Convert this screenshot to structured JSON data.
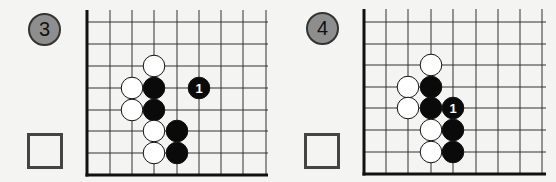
{
  "problems": [
    {
      "number": "3",
      "board": {
        "origin_x": 87,
        "bottom_y": 175,
        "cols_x": [
          87,
          110,
          132,
          154,
          177,
          199,
          221,
          243,
          266
        ],
        "rows_y": [
          22,
          44,
          66,
          88,
          110,
          131,
          153,
          175
        ],
        "top_y": 10,
        "right_x": 268,
        "stones": [
          {
            "color": "white",
            "x": 154,
            "y": 66,
            "label": ""
          },
          {
            "color": "white",
            "x": 132,
            "y": 88,
            "label": ""
          },
          {
            "color": "black",
            "x": 154,
            "y": 88,
            "label": ""
          },
          {
            "color": "black",
            "x": 199,
            "y": 88,
            "label": "1"
          },
          {
            "color": "white",
            "x": 132,
            "y": 110,
            "label": ""
          },
          {
            "color": "black",
            "x": 154,
            "y": 110,
            "label": ""
          },
          {
            "color": "white",
            "x": 154,
            "y": 131,
            "label": ""
          },
          {
            "color": "black",
            "x": 177,
            "y": 131,
            "label": ""
          },
          {
            "color": "white",
            "x": 154,
            "y": 153,
            "label": ""
          },
          {
            "color": "black",
            "x": 177,
            "y": 153,
            "label": ""
          }
        ]
      }
    },
    {
      "number": "4",
      "board": {
        "origin_x": 364,
        "bottom_y": 174,
        "cols_x": [
          364,
          386,
          408,
          431,
          453,
          476,
          498,
          520,
          542
        ],
        "rows_y": [
          22,
          44,
          65,
          87,
          108,
          130,
          152,
          174
        ],
        "top_y": 9,
        "right_x": 546,
        "stones": [
          {
            "color": "white",
            "x": 431,
            "y": 65,
            "label": ""
          },
          {
            "color": "white",
            "x": 408,
            "y": 87,
            "label": ""
          },
          {
            "color": "black",
            "x": 431,
            "y": 87,
            "label": ""
          },
          {
            "color": "white",
            "x": 408,
            "y": 108,
            "label": ""
          },
          {
            "color": "black",
            "x": 431,
            "y": 108,
            "label": ""
          },
          {
            "color": "black",
            "x": 453,
            "y": 108,
            "label": "1"
          },
          {
            "color": "white",
            "x": 431,
            "y": 130,
            "label": ""
          },
          {
            "color": "black",
            "x": 453,
            "y": 130,
            "label": ""
          },
          {
            "color": "white",
            "x": 431,
            "y": 152,
            "label": ""
          },
          {
            "color": "black",
            "x": 453,
            "y": 152,
            "label": ""
          }
        ]
      }
    }
  ]
}
